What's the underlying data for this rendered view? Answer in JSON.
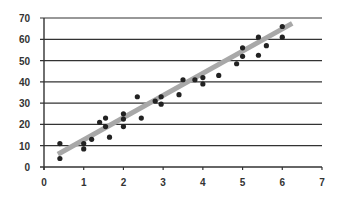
{
  "chart_data": {
    "type": "scatter",
    "title": "",
    "xlabel": "",
    "ylabel": "",
    "xlim": [
      0,
      7
    ],
    "ylim": [
      0,
      70
    ],
    "x_ticks": [
      0,
      1,
      2,
      3,
      4,
      5,
      6,
      7
    ],
    "y_ticks": [
      0,
      10,
      20,
      30,
      40,
      50,
      60,
      70
    ],
    "grid": "horizontal",
    "legend": null,
    "series": [
      {
        "name": "data",
        "points": [
          [
            0.4,
            11
          ],
          [
            0.4,
            4
          ],
          [
            1.0,
            11
          ],
          [
            1.0,
            8.5
          ],
          [
            1.2,
            13
          ],
          [
            1.4,
            21
          ],
          [
            1.55,
            23
          ],
          [
            1.55,
            19
          ],
          [
            1.65,
            14
          ],
          [
            2.0,
            25
          ],
          [
            2.0,
            22.5
          ],
          [
            2.0,
            19
          ],
          [
            2.45,
            23
          ],
          [
            2.35,
            33
          ],
          [
            2.8,
            31
          ],
          [
            2.95,
            33
          ],
          [
            2.95,
            29.5
          ],
          [
            3.4,
            34
          ],
          [
            3.5,
            41
          ],
          [
            3.8,
            41
          ],
          [
            4.0,
            42
          ],
          [
            4.0,
            39
          ],
          [
            4.4,
            43
          ],
          [
            4.85,
            48.5
          ],
          [
            5.0,
            56
          ],
          [
            5.0,
            52
          ],
          [
            5.4,
            61
          ],
          [
            5.4,
            52.5
          ],
          [
            5.6,
            57
          ],
          [
            6.0,
            66
          ],
          [
            6.0,
            61
          ]
        ]
      }
    ],
    "trendline": {
      "x": [
        0.35,
        6.25
      ],
      "y": [
        6,
        67.5
      ],
      "color": "#a8a8a8"
    }
  },
  "colors": {
    "axis": "#333333",
    "grid": "#333333",
    "point": "#222222",
    "trend": "#a8a8a8"
  }
}
